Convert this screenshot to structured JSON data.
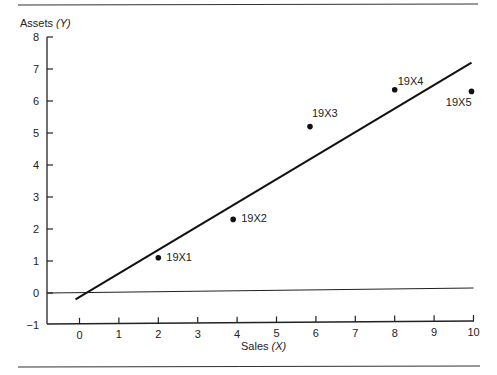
{
  "chart_data": {
    "type": "scatter",
    "title": "",
    "xlabel": "Sales",
    "xlabel_var": "(X)",
    "ylabel": "Assets",
    "ylabel_var": "(Y)",
    "xlim": [
      0,
      10
    ],
    "ylim": [
      -1,
      8
    ],
    "xticks": [
      0,
      1,
      2,
      3,
      4,
      5,
      6,
      7,
      8,
      9,
      10
    ],
    "yticks": [
      -1,
      0,
      1,
      2,
      3,
      4,
      5,
      6,
      7,
      8
    ],
    "grid": false,
    "points": [
      {
        "label": "19X1",
        "x": 2.0,
        "y": 1.1
      },
      {
        "label": "19X2",
        "x": 3.9,
        "y": 2.3
      },
      {
        "label": "19X3",
        "x": 5.85,
        "y": 5.2
      },
      {
        "label": "19X4",
        "x": 8.0,
        "y": 6.35
      },
      {
        "label": "19X5",
        "x": 9.95,
        "y": 6.3
      }
    ],
    "fit_line": {
      "x1": -0.1,
      "y1": -0.2,
      "x2": 9.95,
      "y2": 7.2
    },
    "zero_line": {
      "y": 0,
      "x_start": -0.9,
      "x_end": 10,
      "slope_note": "slightly rising"
    }
  }
}
